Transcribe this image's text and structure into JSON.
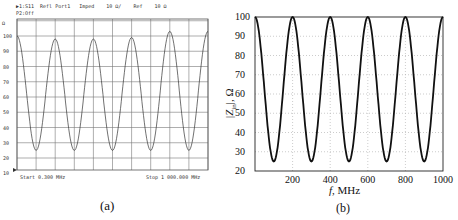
{
  "panel_a": {
    "header_line1": "▶1:S11  Refl Port1   Imped    10 Ω/    Ref    10 Ω",
    "header_line2": "P2:Off",
    "start_label": "Start 0.300 MHz",
    "stop_label": "Stop 1 000.000 MHz",
    "axis_top_marker": "Ω",
    "y_ticks": [
      "100",
      "90",
      "80",
      "70",
      "60",
      "50",
      "40",
      "30",
      "20",
      "10"
    ],
    "caption": "(a)"
  },
  "panel_b": {
    "ylabel": "|Z_in|, Ω",
    "xlabel": "f, MHz",
    "y_ticks": [
      "100",
      "90",
      "80",
      "70",
      "60",
      "50",
      "40",
      "30",
      "20"
    ],
    "x_ticks": [
      "200",
      "400",
      "600",
      "800",
      "1000"
    ],
    "caption": "(b)"
  },
  "chart_data": [
    {
      "type": "line",
      "title": "S11 Refl Port1 Imped (VNA measurement)",
      "xlabel": "Frequency (Start 0.300 MHz, Stop 1000.000 MHz)",
      "ylabel": "Impedance, Ω",
      "xlim": [
        0.3,
        1000
      ],
      "ylim": [
        10,
        110
      ],
      "grid": true,
      "series": [
        {
          "name": "Measured |Z|",
          "x": [
            0.3,
            100,
            200,
            300,
            400,
            500,
            600,
            700,
            800,
            900,
            1000
          ],
          "values": [
            100,
            25,
            98,
            25,
            98,
            25,
            99,
            25,
            103,
            25,
            103
          ]
        }
      ]
    },
    {
      "type": "line",
      "title": "",
      "xlabel": "f, MHz",
      "ylabel": "|Z_in|, Ω",
      "xlim": [
        0,
        1000
      ],
      "ylim": [
        20,
        100
      ],
      "grid": true,
      "series": [
        {
          "name": "Simulated |Z_in|",
          "x": [
            0,
            100,
            200,
            300,
            400,
            500,
            600,
            700,
            800,
            900,
            1000
          ],
          "values": [
            100,
            25,
            100,
            25,
            100,
            25,
            100,
            25,
            100,
            25,
            100
          ]
        }
      ]
    }
  ]
}
